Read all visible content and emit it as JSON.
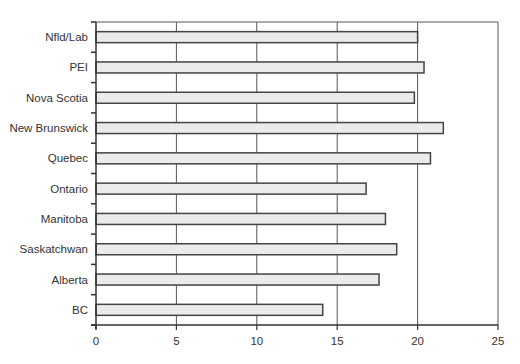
{
  "chart_data": {
    "type": "bar",
    "orientation": "horizontal",
    "title": "",
    "xlabel": "",
    "ylabel": "",
    "categories": [
      "Nfld/Lab",
      "PEI",
      "Nova Scotia",
      "New Brunswick",
      "Quebec",
      "Ontario",
      "Manitoba",
      "Saskatchwan",
      "Alberta",
      "BC"
    ],
    "values": [
      20.0,
      20.4,
      19.8,
      21.6,
      20.8,
      16.8,
      18.0,
      18.7,
      17.6,
      14.1
    ],
    "xlim": [
      0,
      25
    ],
    "xticks": [
      0,
      5,
      10,
      15,
      20,
      25
    ],
    "grid": "vertical",
    "legend": "none",
    "colors": {
      "bar_fill": "#ebebeb",
      "bar_stroke": "#444444",
      "grid": "#555555",
      "axis": "#333333"
    }
  }
}
